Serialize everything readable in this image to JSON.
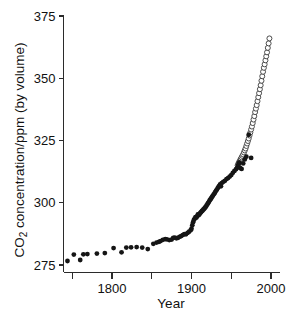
{
  "chart_data": {
    "type": "scatter",
    "title": "",
    "xlabel": "Year",
    "ylabel": "CO₂ concentration/ppm (by volume)",
    "xlim": [
      1735,
      2005
    ],
    "ylim": [
      272,
      375
    ],
    "grid": false,
    "legend": "none",
    "x_ticks": [
      1750,
      1800,
      1850,
      1900,
      1950,
      2000
    ],
    "x_tick_labels": [
      "",
      "1800",
      "",
      "1900",
      "",
      "2000"
    ],
    "y_ticks": [
      275,
      300,
      325,
      350,
      375
    ],
    "y_tick_labels": [
      "275",
      "300",
      "325",
      "350",
      "375"
    ],
    "series": [
      {
        "name": "ice-core-filled",
        "marker": "filled-circle",
        "color": "#151515",
        "points": [
          [
            1744,
            276.6
          ],
          [
            1752,
            279.2
          ],
          [
            1760,
            277.0
          ],
          [
            1764,
            279.3
          ],
          [
            1769,
            279.4
          ],
          [
            1781,
            279.6
          ],
          [
            1791,
            279.8
          ],
          [
            1802,
            281.8
          ],
          [
            1812,
            280.1
          ],
          [
            1818,
            282.0
          ],
          [
            1824,
            282.1
          ],
          [
            1831,
            282.2
          ],
          [
            1838,
            282.0
          ],
          [
            1845,
            281.4
          ],
          [
            1852,
            283.5
          ],
          [
            1856,
            284.0
          ],
          [
            1859,
            284.3
          ],
          [
            1861,
            284.6
          ],
          [
            1864,
            285.1
          ],
          [
            1867,
            285.4
          ],
          [
            1869,
            285.3
          ],
          [
            1872,
            285.0
          ],
          [
            1875,
            285.2
          ],
          [
            1877,
            285.9
          ],
          [
            1879,
            286.0
          ],
          [
            1881,
            285.7
          ],
          [
            1883,
            285.9
          ],
          [
            1885,
            286.3
          ],
          [
            1887,
            286.6
          ],
          [
            1889,
            287.0
          ],
          [
            1891,
            287.4
          ],
          [
            1893,
            287.3
          ],
          [
            1895,
            287.9
          ],
          [
            1897,
            288.4
          ],
          [
            1899,
            289.0
          ],
          [
            1900,
            289.6
          ],
          [
            1901,
            291.0
          ],
          [
            1902,
            292.2
          ],
          [
            1903,
            293.1
          ],
          [
            1904,
            293.6
          ],
          [
            1905,
            294.2
          ],
          [
            1906,
            294.0
          ],
          [
            1907,
            294.5
          ],
          [
            1908,
            295.3
          ],
          [
            1909,
            295.0
          ],
          [
            1910,
            295.4
          ],
          [
            1911,
            295.9
          ],
          [
            1912,
            296.2
          ],
          [
            1913,
            296.6
          ],
          [
            1914,
            296.9
          ],
          [
            1915,
            297.3
          ],
          [
            1916,
            297.6
          ],
          [
            1917,
            298.0
          ],
          [
            1918,
            298.4
          ],
          [
            1919,
            298.9
          ],
          [
            1920,
            299.4
          ],
          [
            1921,
            299.9
          ],
          [
            1922,
            300.4
          ],
          [
            1923,
            301.0
          ],
          [
            1924,
            301.4
          ],
          [
            1925,
            301.9
          ],
          [
            1926,
            302.4
          ],
          [
            1927,
            302.9
          ],
          [
            1928,
            303.4
          ],
          [
            1929,
            303.8
          ],
          [
            1930,
            304.4
          ],
          [
            1931,
            304.9
          ],
          [
            1932,
            305.3
          ],
          [
            1933,
            305.9
          ],
          [
            1934,
            306.4
          ],
          [
            1935,
            306.8
          ],
          [
            1936,
            307.4
          ],
          [
            1937,
            306.6
          ],
          [
            1938,
            307.9
          ],
          [
            1940,
            308.4
          ],
          [
            1942,
            308.8
          ],
          [
            1944,
            309.5
          ],
          [
            1946,
            309.9
          ],
          [
            1948,
            310.5
          ],
          [
            1950,
            311.1
          ],
          [
            1952,
            312.0
          ],
          [
            1954,
            312.8
          ],
          [
            1956,
            313.5
          ],
          [
            1958,
            314.6
          ],
          [
            1959,
            315.5
          ],
          [
            1960,
            316.2
          ],
          [
            1961,
            314.0
          ],
          [
            1963,
            313.6
          ],
          [
            1965,
            315.8
          ],
          [
            1967,
            317.4
          ],
          [
            1969,
            318.5
          ],
          [
            1972,
            327.3
          ],
          [
            1975,
            318.0
          ]
        ]
      },
      {
        "name": "mauna-loa-open",
        "marker": "open-circle",
        "color": "#ffffff",
        "points": [
          [
            1958,
            315.0
          ],
          [
            1959,
            315.8
          ],
          [
            1960,
            316.4
          ],
          [
            1961,
            317.0
          ],
          [
            1962,
            317.6
          ],
          [
            1963,
            318.2
          ],
          [
            1964,
            318.8
          ],
          [
            1965,
            319.4
          ],
          [
            1966,
            320.2
          ],
          [
            1967,
            321.0
          ],
          [
            1968,
            321.8
          ],
          [
            1969,
            322.8
          ],
          [
            1970,
            323.8
          ],
          [
            1971,
            324.8
          ],
          [
            1972,
            325.8
          ],
          [
            1973,
            327.0
          ],
          [
            1974,
            328.2
          ],
          [
            1975,
            329.4
          ],
          [
            1976,
            330.6
          ],
          [
            1977,
            332.0
          ],
          [
            1978,
            333.4
          ],
          [
            1979,
            334.8
          ],
          [
            1980,
            336.4
          ],
          [
            1981,
            337.8
          ],
          [
            1982,
            339.2
          ],
          [
            1983,
            340.8
          ],
          [
            1984,
            342.4
          ],
          [
            1985,
            344.0
          ],
          [
            1986,
            345.6
          ],
          [
            1987,
            347.2
          ],
          [
            1988,
            349.0
          ],
          [
            1989,
            350.8
          ],
          [
            1990,
            352.6
          ],
          [
            1991,
            354.2
          ],
          [
            1992,
            355.6
          ],
          [
            1993,
            357.2
          ],
          [
            1994,
            358.8
          ],
          [
            1995,
            360.4
          ],
          [
            1996,
            362.2
          ],
          [
            1997,
            364.0
          ],
          [
            1998,
            366.0
          ]
        ]
      }
    ]
  }
}
